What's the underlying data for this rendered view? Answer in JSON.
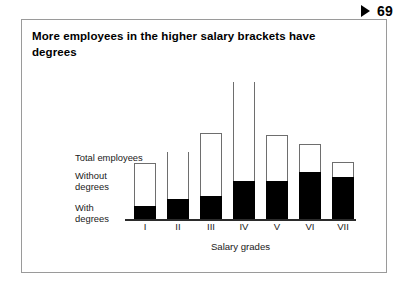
{
  "page": {
    "marker_icon": "play-triangle-icon",
    "number": "69"
  },
  "figure": {
    "title": "More employees in the higher salary brackets have degrees",
    "legend": {
      "total": "Total employees",
      "without": "Without\ndegrees",
      "with": "With\ndegrees"
    }
  },
  "chart_data": {
    "type": "bar",
    "title": "More employees in the higher salary brackets have degrees",
    "xlabel": "Salary grades",
    "ylabel": "",
    "grid": false,
    "legend_position": "left-inside",
    "stacked": true,
    "ylim": [
      0,
      100
    ],
    "categories": [
      "I",
      "II",
      "III",
      "IV",
      "V",
      "VI",
      "VII"
    ],
    "series": [
      {
        "name": "With degrees",
        "color": "#000000",
        "values": [
          8,
          13,
          14,
          24,
          24,
          29,
          26
        ]
      },
      {
        "name": "Without degrees",
        "color": "#ffffff",
        "values": [
          27,
          29,
          40,
          62,
          29,
          17,
          9
        ]
      }
    ],
    "totals": [
      35,
      42,
      54,
      86,
      53,
      46,
      35
    ]
  },
  "bars": [
    {
      "label": "I",
      "x": 9,
      "total_h": 56,
      "fill_h": 13,
      "open": false
    },
    {
      "label": "II",
      "x": 42,
      "total_h": 67,
      "fill_h": 20,
      "open": true
    },
    {
      "label": "III",
      "x": 75,
      "total_h": 86,
      "fill_h": 23,
      "open": false
    },
    {
      "label": "IV",
      "x": 108,
      "total_h": 137,
      "fill_h": 38,
      "open": true
    },
    {
      "label": "V",
      "x": 141,
      "total_h": 84,
      "fill_h": 38,
      "open": false
    },
    {
      "label": "VI",
      "x": 174,
      "total_h": 75,
      "fill_h": 47,
      "open": false
    },
    {
      "label": "VII",
      "x": 207,
      "total_h": 57,
      "fill_h": 42,
      "open": false
    }
  ]
}
